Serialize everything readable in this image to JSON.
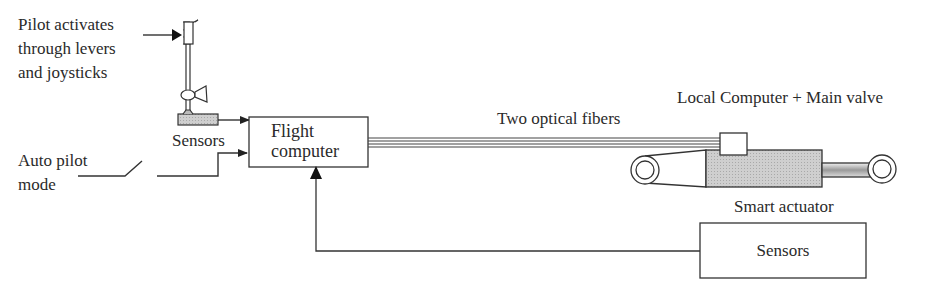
{
  "diagram": {
    "labels": {
      "pilot_line1": "Pilot activates",
      "pilot_line2": "through levers",
      "pilot_line3": "and joysticks",
      "sensors_top": "Sensors",
      "autopilot_line1": "Auto pilot",
      "autopilot_line2": "mode",
      "flight_computer_line1": "Flight",
      "flight_computer_line2": "computer",
      "optical_fibers": "Two optical fibers",
      "local_computer": "Local Computer  + Main valve",
      "smart_actuator": "Smart actuator",
      "sensors_bottom": "Sensors"
    },
    "colors": {
      "stroke": "#333333",
      "fill_gray": "#c8c8c8",
      "background": "#ffffff"
    }
  }
}
